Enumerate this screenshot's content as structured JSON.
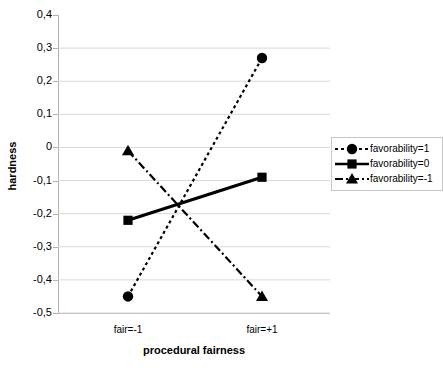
{
  "chart_data": {
    "type": "line",
    "title": "",
    "xlabel": "procedural fairness",
    "ylabel": "hardness",
    "categories": [
      "fair=-1",
      "fair=+1"
    ],
    "x": [
      -1,
      1
    ],
    "ylim": [
      -0.5,
      0.4
    ],
    "yticks": [
      "0,4",
      "0,3",
      "0,2",
      "0,1",
      "0",
      "-0,1",
      "-0,2",
      "-0,3",
      "-0,4",
      "-0,5"
    ],
    "ytick_values": [
      0.4,
      0.3,
      0.2,
      0.1,
      0,
      -0.1,
      -0.2,
      -0.3,
      -0.4,
      -0.5
    ],
    "grid": true,
    "legend_position": "right",
    "series": [
      {
        "name": "favorability=1",
        "values": [
          -0.45,
          0.27
        ],
        "marker": "circle",
        "linestyle": "dotted",
        "color": "#000000"
      },
      {
        "name": "favorability=0",
        "values": [
          -0.22,
          -0.09
        ],
        "marker": "square",
        "linestyle": "solid",
        "color": "#000000"
      },
      {
        "name": "favorability=-1",
        "values": [
          -0.01,
          -0.45
        ],
        "marker": "triangle",
        "linestyle": "dashdot",
        "color": "#000000"
      }
    ]
  },
  "legend": {
    "items": [
      {
        "label": "favorability=1"
      },
      {
        "label": "favorability=0"
      },
      {
        "label": "favorability=-1"
      }
    ]
  },
  "colors": {
    "series": "#000000",
    "grid": "#d9d9d9",
    "axis": "#b0b0b0",
    "legend_border": "#c8c8c8",
    "background": "#ffffff"
  }
}
